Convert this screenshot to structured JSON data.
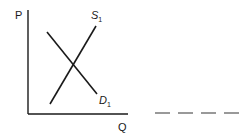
{
  "diagram": {
    "type": "supply-demand",
    "y_axis_label": "P",
    "x_axis_label": "Q",
    "supply": {
      "label": "S",
      "subscript": "1"
    },
    "demand": {
      "label": "D",
      "subscript": "1"
    },
    "blank": {
      "dashes": 4
    }
  },
  "colors": {
    "ink": "#1a1a1a",
    "background": "#ffffff",
    "dash": "#555555"
  }
}
